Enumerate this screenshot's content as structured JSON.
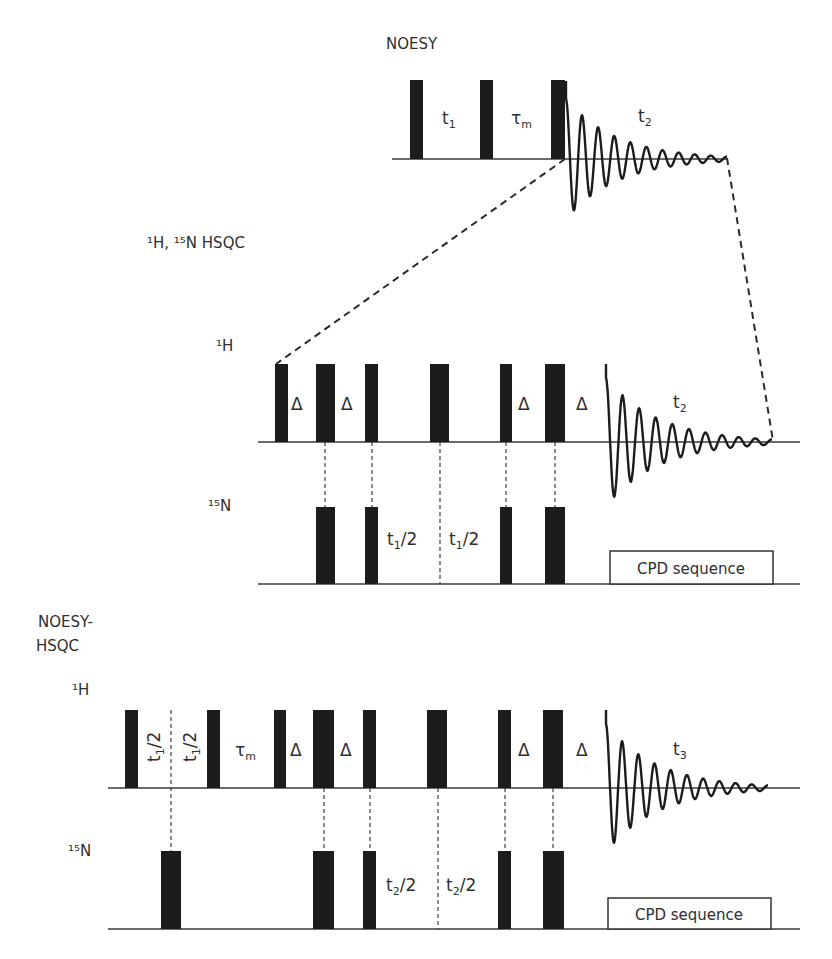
{
  "sections": {
    "noesy": {
      "title": "NOESY",
      "delays": [
        {
          "text": "t",
          "sub": "1"
        },
        {
          "text": "τ",
          "sub": "m"
        },
        {
          "text": "t",
          "sub": "2"
        }
      ]
    },
    "hsqc": {
      "title": "¹H, ¹⁵N HSQC",
      "channels": {
        "h": "¹H",
        "n": "¹⁵N"
      },
      "h_delays": [
        "Δ",
        "Δ",
        "Δ",
        "Δ"
      ],
      "acq_label": {
        "text": "t",
        "sub": "2"
      },
      "n_delays": [
        {
          "text": "t",
          "sub": "1",
          "rest": "/2"
        },
        {
          "text": "t",
          "sub": "1",
          "rest": "/2"
        }
      ],
      "cpd_label": "CPD sequence"
    },
    "noesy_hsqc": {
      "title_line1": "NOESY-",
      "title_line2": "HSQC",
      "channels": {
        "h": "¹H",
        "n": "¹⁵N"
      },
      "h_delays_rotated": [
        {
          "text": "t",
          "sub": "1",
          "rest": "/2"
        },
        {
          "text": "t",
          "sub": "1",
          "rest": "/2"
        }
      ],
      "mixing": {
        "text": "τ",
        "sub": "m"
      },
      "h_delays": [
        "Δ",
        "Δ",
        "Δ",
        "Δ"
      ],
      "acq_label": {
        "text": "t",
        "sub": "3"
      },
      "n_delays": [
        {
          "text": "t",
          "sub": "2",
          "rest": "/2"
        },
        {
          "text": "t",
          "sub": "2",
          "rest": "/2"
        }
      ],
      "cpd_label": "CPD sequence"
    }
  },
  "fid_shape_estimate": {
    "note": "approximate damped sinusoid traced from the image; not measured data",
    "oscillations": 10,
    "decay": 3.2
  },
  "colors": {
    "pulse": "#1c1c1c",
    "line": "#3a3a3a",
    "text": "#2e2e2e"
  }
}
